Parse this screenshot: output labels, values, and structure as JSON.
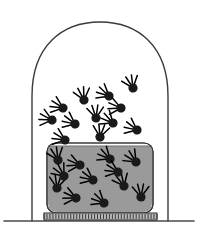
{
  "figure": {
    "width": 198,
    "height": 235,
    "background_color": "#ffffff"
  },
  "colors": {
    "outline": "#3b3b3b",
    "ground_line": "#4a4a4a",
    "liquid_fill": "#9a9a9a",
    "liquid_edge": "#6f6f6f",
    "particle_fill": "#1a1a1a",
    "particle_stroke": "#000000",
    "vessel_stroke": "#3a3a3a",
    "vessel_fill": "#ffffff",
    "base_fill": "#b8b8b8",
    "base_hatch": "#2e2e2e",
    "background": "#ffffff"
  },
  "bell_jar": {
    "label": "bell-jar-dome",
    "left_x": 32,
    "right_x": 168,
    "top_y": 22,
    "bottom_y": 221,
    "shoulder_y": 95,
    "stroke_width": 1.4,
    "path": "M 32 221 L 32 96 C 32 46 62 22 100 22 C 138 22 168 46 168 96 L 168 221"
  },
  "ground": {
    "label": "ground-line",
    "left_x": 4,
    "right_x": 194,
    "y": 221,
    "stroke_width": 1.6
  },
  "vessel": {
    "label": "liquid-container",
    "left_x": 47,
    "right_x": 153,
    "top_y": 143,
    "bottom_y": 213,
    "corner_radius": 9,
    "stroke_width": 1.2
  },
  "liquid": {
    "label": "liquid-body",
    "surface_y": 146,
    "bottom_y": 212,
    "left_x": 48,
    "right_x": 152,
    "fill": "#9a9a9a"
  },
  "heater_base": {
    "label": "heating-base-plate",
    "left_x": 44,
    "right_x": 157,
    "top_y": 213,
    "bottom_y": 220,
    "hatch_count": 38
  },
  "legend": {
    "gas_region_label": "vapour (gas phase)",
    "liquid_region_label": "liquid phase",
    "particle_label": "molecule in motion"
  },
  "particles": {
    "particle_radius": 4.6,
    "trail_length": 9,
    "trail_count": 4,
    "gas_count": 12,
    "liquid_count": 12,
    "gas": [
      {
        "x": 133,
        "y": 88,
        "angle": 250
      },
      {
        "x": 109,
        "y": 96,
        "angle": 210
      },
      {
        "x": 84,
        "y": 100,
        "angle": 255
      },
      {
        "x": 63,
        "y": 108,
        "angle": 200
      },
      {
        "x": 96,
        "y": 118,
        "angle": 265
      },
      {
        "x": 75,
        "y": 124,
        "angle": 205
      },
      {
        "x": 113,
        "y": 123,
        "angle": 215
      },
      {
        "x": 137,
        "y": 130,
        "angle": 205
      },
      {
        "x": 100,
        "y": 137,
        "angle": 278
      },
      {
        "x": 65,
        "y": 140,
        "angle": 200
      },
      {
        "x": 121,
        "y": 108,
        "angle": 190
      },
      {
        "x": 52,
        "y": 120,
        "angle": 195
      }
    ],
    "liquid": [
      {
        "x": 58,
        "y": 160,
        "angle": 250
      },
      {
        "x": 80,
        "y": 165,
        "angle": 190
      },
      {
        "x": 110,
        "y": 159,
        "angle": 215
      },
      {
        "x": 136,
        "y": 162,
        "angle": 225
      },
      {
        "x": 93,
        "y": 180,
        "angle": 205
      },
      {
        "x": 124,
        "y": 186,
        "angle": 245
      },
      {
        "x": 57,
        "y": 188,
        "angle": 275
      },
      {
        "x": 76,
        "y": 198,
        "angle": 192
      },
      {
        "x": 104,
        "y": 203,
        "angle": 212
      },
      {
        "x": 141,
        "y": 197,
        "angle": 268
      },
      {
        "x": 64,
        "y": 176,
        "angle": 230
      },
      {
        "x": 118,
        "y": 172,
        "angle": 200
      }
    ]
  }
}
